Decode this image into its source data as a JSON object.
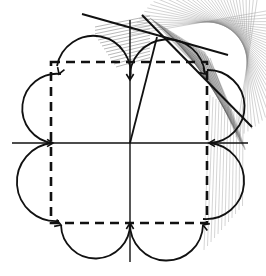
{
  "figure": {
    "kind": "geometric-construction",
    "colors": {
      "background": "#ffffff",
      "stroke": "#111111",
      "hatch": "#888888",
      "hatch_dense": "#555555"
    },
    "center": [
      130,
      143
    ],
    "square": {
      "x0": 51,
      "y0": 62,
      "x1": 207,
      "y1": 223
    },
    "axes": {
      "horizontal": {
        "x0": 12,
        "x1": 248,
        "y": 143
      },
      "vertical": {
        "x": 130,
        "y0": 20,
        "y1": 262
      }
    },
    "radial_line": {
      "from": [
        130,
        143
      ],
      "to": [
        157,
        37
      ]
    },
    "tangent_lines": [
      {
        "from": [
          82,
          14
        ],
        "to": [
          228,
          55
        ]
      },
      {
        "from": [
          142,
          15
        ],
        "to": [
          252,
          127
        ]
      }
    ],
    "arc_radius": 39
  }
}
